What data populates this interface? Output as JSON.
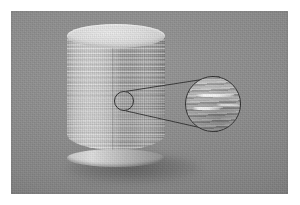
{
  "figure": {
    "domain": "Natural-Image",
    "caption": "",
    "media_type": "grayscale-photograph",
    "border": {
      "color": "#ffffff",
      "width_px": 11
    },
    "plate": {
      "x": 11,
      "y": 11,
      "width": 277,
      "height": 183,
      "background_color": "#8a8a8a",
      "description": "Uniform mid-gray studio backdrop with visible photographic film grain"
    }
  },
  "subject": {
    "name": "3d-printed-cylinder",
    "label": "Cylindrical printed specimen",
    "shape": "right circular cylinder",
    "geometry": {
      "x": 67,
      "y": 24,
      "width": 98,
      "height": 137
    },
    "top_face": {
      "name": "cylinder-top-face",
      "shape": "ellipse",
      "color": "#e2e2e2",
      "description": "Bright flat top surface seen in slight perspective"
    },
    "side_wall": {
      "name": "cylinder-side-wall",
      "highlight_color": "#dadada",
      "shadow_color": "#8f8f8f",
      "texture": "horizontal additive-manufacturing layer lines",
      "seam": "vertical print start/stop seam on right-of-center"
    },
    "ground_shadow": {
      "name": "cast-shadow",
      "color": "#4a4a4a",
      "description": "Soft elliptical shadow cast beneath and to the left of the cylinder"
    }
  },
  "callout": {
    "source_circle": {
      "name": "callout-source-circle",
      "center_x": 124,
      "center_y": 101,
      "radius": 10,
      "stroke_color": "#2b2b2b",
      "description": "Small circle marking the inspected region on the cylinder wall"
    },
    "magnifier_circle": {
      "name": "magnifier-detail-circle",
      "center_x": 213,
      "center_y": 104,
      "radius": 28,
      "stroke_color": "#2b2b2b",
      "description": "Enlarged view of the boxed region showing layer lines and bright void defects"
    },
    "leader_lines": {
      "name": "callout-leader-lines",
      "stroke_color": "#2b2b2b",
      "count": 2,
      "description": "Two tangent lines connecting the source circle to the magnified circle"
    },
    "defects": [
      {
        "name": "defect-streak-upper",
        "appearance": "bright white elongated streak",
        "color": "#ffffff"
      },
      {
        "name": "defect-streak-lower",
        "appearance": "bright white elongated streak",
        "color": "#ffffff"
      },
      {
        "name": "defect-streak-lower-secondary",
        "appearance": "short bright white streak",
        "color": "#ffffff"
      }
    ]
  },
  "palette": {
    "background_gray": "#8a8a8a",
    "cylinder_highlight": "#dadada",
    "cylinder_midtone": "#b4b4b4",
    "cylinder_shadow": "#8f8f8f",
    "top_face": "#e2e2e2",
    "ink": "#2b2b2b",
    "defect_white": "#ffffff",
    "page_white": "#ffffff"
  }
}
